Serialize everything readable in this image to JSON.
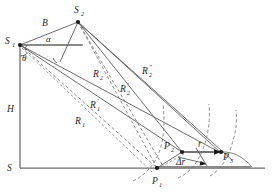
{
  "figure": {
    "type": "geometry-diagram",
    "width": 272,
    "height": 196,
    "stroke_color": "#5a5a5a",
    "label_color": "#1f1f1f"
  },
  "labels": {
    "s1": "S",
    "s1_sub": "1",
    "s2": "S",
    "s2_sub": "2",
    "baseline": "B",
    "alpha": "α",
    "theta": "θ",
    "height": "H",
    "surface": "S",
    "p1": "P",
    "p1_sub": "1",
    "p2": "P",
    "p2_sub": "2",
    "p3": "P",
    "p3_sub": "3",
    "r1": "R",
    "r1_sub": "1",
    "r1p": "R",
    "r1p_sub": "1",
    "r1p_prime": "′",
    "r2": "R",
    "r2_sub": "2",
    "r2p": "R",
    "r2p_sub": "2",
    "r2p_prime": "′",
    "r2pp": "R",
    "r2pp_sub": "2",
    "r2pp_prime": "″",
    "r_vec": "r",
    "delta_r": "Δr"
  },
  "points": {
    "s1": [
      20,
      45
    ],
    "s2": [
      78,
      22
    ],
    "origin": [
      20,
      168
    ],
    "p1": [
      157,
      168
    ],
    "p2": [
      182,
      152
    ],
    "p3": [
      221,
      153
    ],
    "baseline_right_end": [
      265,
      168
    ],
    "horiz_ref_end": [
      80,
      45
    ]
  },
  "geometry_notes": {
    "vertical_axis": "H measured from S (ground) up to S1",
    "horizontal_axis": "ground surface S",
    "arrows": [
      "r from P2 to P3",
      "delta-r short arrow below r"
    ],
    "arcs": [
      "range arc through P2 and P1",
      "range arc through P3",
      "terrain arc right of P3"
    ]
  }
}
